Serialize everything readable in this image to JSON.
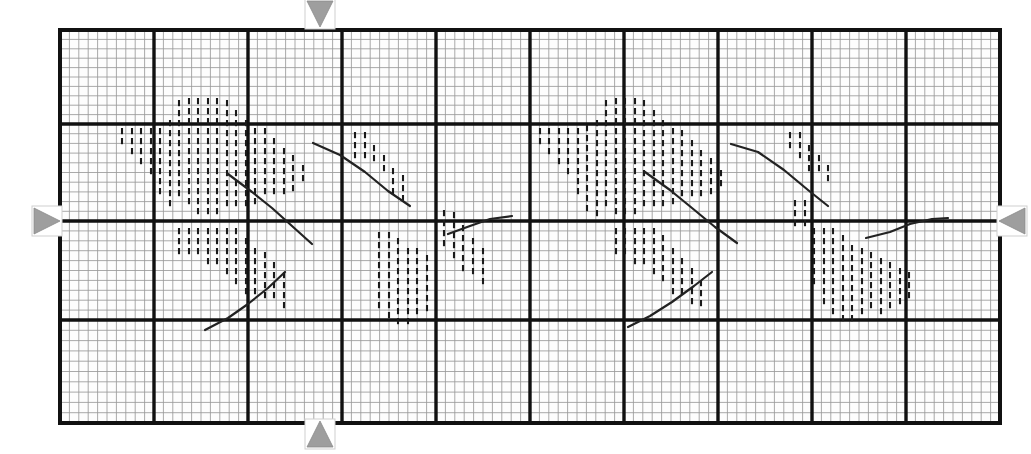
{
  "document": {
    "kind": "scanned-chart-recording",
    "title": "Strip Chart Recording Sheet",
    "background_color": "#ffffff",
    "paper_color": "#fdfdfd",
    "minor_grid_color": "#9a9a9a",
    "major_grid_color": "#111111",
    "tick_mark_color": "#1a1a1a",
    "curve_color": "#222222",
    "marker_color": "#9e9e9e",
    "marker_outline_color": "#cfcfcf"
  },
  "plot_frame": {
    "left": 60,
    "top": 30,
    "right": 1000,
    "bottom": 423,
    "major_border_width": 4
  },
  "markers": [
    {
      "name": "top-alignment-marker",
      "glyph": "triangle-down",
      "x": 320,
      "y": 14,
      "size": 13
    },
    {
      "name": "bottom-alignment-marker",
      "glyph": "triangle-up",
      "x": 320,
      "y": 434,
      "size": 13
    },
    {
      "name": "left-alignment-marker",
      "glyph": "triangle-right",
      "x": 47,
      "y": 221,
      "size": 13
    },
    {
      "name": "right-alignment-marker",
      "glyph": "triangle-left",
      "x": 1012,
      "y": 221,
      "size": 13
    }
  ],
  "chart_data": {
    "type": "scatter",
    "subtitle": "",
    "xlabel": "",
    "ylabel": "",
    "grid": true,
    "legend_position": "none",
    "axis_ranges": {
      "xlim": [
        0,
        10
      ],
      "ylim": [
        0,
        4
      ]
    },
    "grid_structure": {
      "major_columns": 10,
      "major_rows": 4,
      "minor_per_major_x": 10,
      "minor_per_major_y": 10,
      "major_x_positions": [
        60,
        154,
        248,
        342,
        436,
        530,
        624,
        718,
        812,
        906,
        1000
      ],
      "major_y_positions": [
        30,
        124,
        221,
        320,
        423
      ]
    },
    "series": [
      {
        "name": "tick-cluster-left-upper",
        "style": "vertical-dash-marks",
        "columns": [
          {
            "x": 122,
            "count": 2,
            "y_start": 128,
            "step": 10
          },
          {
            "x": 132,
            "count": 3,
            "y_start": 128,
            "step": 10
          },
          {
            "x": 141,
            "count": 4,
            "y_start": 128,
            "step": 10
          },
          {
            "x": 151,
            "count": 5,
            "y_start": 128,
            "step": 10
          },
          {
            "x": 160,
            "count": 7,
            "y_start": 128,
            "step": 10
          },
          {
            "x": 170,
            "count": 9,
            "y_start": 120,
            "step": 10
          },
          {
            "x": 179,
            "count": 10,
            "y_start": 100,
            "step": 10
          },
          {
            "x": 189,
            "count": 11,
            "y_start": 98,
            "step": 10
          },
          {
            "x": 198,
            "count": 12,
            "y_start": 98,
            "step": 10
          },
          {
            "x": 208,
            "count": 12,
            "y_start": 98,
            "step": 10
          },
          {
            "x": 217,
            "count": 12,
            "y_start": 98,
            "step": 10
          },
          {
            "x": 227,
            "count": 11,
            "y_start": 100,
            "step": 10
          },
          {
            "x": 236,
            "count": 10,
            "y_start": 110,
            "step": 10
          },
          {
            "x": 246,
            "count": 9,
            "y_start": 120,
            "step": 10
          },
          {
            "x": 255,
            "count": 8,
            "y_start": 128,
            "step": 10
          },
          {
            "x": 265,
            "count": 7,
            "y_start": 128,
            "step": 10
          },
          {
            "x": 274,
            "count": 6,
            "y_start": 138,
            "step": 10
          },
          {
            "x": 284,
            "count": 5,
            "y_start": 148,
            "step": 10
          },
          {
            "x": 293,
            "count": 4,
            "y_start": 155,
            "step": 10
          },
          {
            "x": 303,
            "count": 2,
            "y_start": 165,
            "step": 10
          }
        ]
      },
      {
        "name": "tick-cluster-left-lower",
        "style": "vertical-dash-marks",
        "columns": [
          {
            "x": 179,
            "count": 3,
            "y_start": 228,
            "step": 10
          },
          {
            "x": 189,
            "count": 3,
            "y_start": 228,
            "step": 10
          },
          {
            "x": 198,
            "count": 3,
            "y_start": 228,
            "step": 10
          },
          {
            "x": 208,
            "count": 4,
            "y_start": 228,
            "step": 10
          },
          {
            "x": 217,
            "count": 4,
            "y_start": 228,
            "step": 10
          },
          {
            "x": 227,
            "count": 5,
            "y_start": 228,
            "step": 10
          },
          {
            "x": 236,
            "count": 6,
            "y_start": 228,
            "step": 10
          },
          {
            "x": 246,
            "count": 6,
            "y_start": 238,
            "step": 10
          },
          {
            "x": 255,
            "count": 5,
            "y_start": 248,
            "step": 10
          },
          {
            "x": 265,
            "count": 5,
            "y_start": 252,
            "step": 10
          },
          {
            "x": 274,
            "count": 4,
            "y_start": 262,
            "step": 10
          },
          {
            "x": 284,
            "count": 4,
            "y_start": 272,
            "step": 10
          }
        ]
      },
      {
        "name": "tick-cluster-mid-left",
        "style": "vertical-dash-marks",
        "columns": [
          {
            "x": 355,
            "count": 3,
            "y_start": 132,
            "step": 10
          },
          {
            "x": 365,
            "count": 3,
            "y_start": 132,
            "step": 10
          },
          {
            "x": 374,
            "count": 2,
            "y_start": 145,
            "step": 10
          },
          {
            "x": 384,
            "count": 2,
            "y_start": 155,
            "step": 10
          },
          {
            "x": 393,
            "count": 3,
            "y_start": 168,
            "step": 10
          },
          {
            "x": 403,
            "count": 3,
            "y_start": 175,
            "step": 10
          },
          {
            "x": 379,
            "count": 8,
            "y_start": 232,
            "step": 10
          },
          {
            "x": 389,
            "count": 9,
            "y_start": 232,
            "step": 10
          },
          {
            "x": 398,
            "count": 9,
            "y_start": 238,
            "step": 10
          },
          {
            "x": 408,
            "count": 8,
            "y_start": 248,
            "step": 10
          },
          {
            "x": 417,
            "count": 7,
            "y_start": 248,
            "step": 10
          },
          {
            "x": 427,
            "count": 6,
            "y_start": 255,
            "step": 10
          },
          {
            "x": 444,
            "count": 4,
            "y_start": 210,
            "step": 10
          },
          {
            "x": 454,
            "count": 5,
            "y_start": 212,
            "step": 10
          },
          {
            "x": 463,
            "count": 5,
            "y_start": 225,
            "step": 10
          },
          {
            "x": 473,
            "count": 4,
            "y_start": 238,
            "step": 10
          },
          {
            "x": 483,
            "count": 4,
            "y_start": 248,
            "step": 10
          }
        ]
      },
      {
        "name": "tick-cluster-right-upper",
        "style": "vertical-dash-marks",
        "columns": [
          {
            "x": 540,
            "count": 2,
            "y_start": 128,
            "step": 10
          },
          {
            "x": 549,
            "count": 3,
            "y_start": 128,
            "step": 10
          },
          {
            "x": 559,
            "count": 4,
            "y_start": 128,
            "step": 10
          },
          {
            "x": 568,
            "count": 5,
            "y_start": 128,
            "step": 10
          },
          {
            "x": 578,
            "count": 7,
            "y_start": 128,
            "step": 10
          },
          {
            "x": 587,
            "count": 9,
            "y_start": 125,
            "step": 10
          },
          {
            "x": 597,
            "count": 10,
            "y_start": 120,
            "step": 10
          },
          {
            "x": 606,
            "count": 11,
            "y_start": 100,
            "step": 10
          },
          {
            "x": 616,
            "count": 12,
            "y_start": 98,
            "step": 10
          },
          {
            "x": 625,
            "count": 12,
            "y_start": 98,
            "step": 10
          },
          {
            "x": 635,
            "count": 12,
            "y_start": 98,
            "step": 10
          },
          {
            "x": 644,
            "count": 11,
            "y_start": 100,
            "step": 10
          },
          {
            "x": 654,
            "count": 10,
            "y_start": 110,
            "step": 10
          },
          {
            "x": 663,
            "count": 9,
            "y_start": 120,
            "step": 10
          },
          {
            "x": 673,
            "count": 8,
            "y_start": 128,
            "step": 10
          },
          {
            "x": 682,
            "count": 7,
            "y_start": 130,
            "step": 10
          },
          {
            "x": 692,
            "count": 6,
            "y_start": 140,
            "step": 10
          },
          {
            "x": 701,
            "count": 5,
            "y_start": 150,
            "step": 10
          },
          {
            "x": 711,
            "count": 4,
            "y_start": 158,
            "step": 10
          },
          {
            "x": 721,
            "count": 2,
            "y_start": 170,
            "step": 10
          }
        ]
      },
      {
        "name": "tick-cluster-right-lower",
        "style": "vertical-dash-marks",
        "columns": [
          {
            "x": 616,
            "count": 3,
            "y_start": 228,
            "step": 10
          },
          {
            "x": 625,
            "count": 3,
            "y_start": 228,
            "step": 10
          },
          {
            "x": 635,
            "count": 4,
            "y_start": 228,
            "step": 10
          },
          {
            "x": 644,
            "count": 4,
            "y_start": 228,
            "step": 10
          },
          {
            "x": 654,
            "count": 5,
            "y_start": 228,
            "step": 10
          },
          {
            "x": 663,
            "count": 5,
            "y_start": 235,
            "step": 10
          },
          {
            "x": 673,
            "count": 5,
            "y_start": 248,
            "step": 10
          },
          {
            "x": 682,
            "count": 4,
            "y_start": 258,
            "step": 10
          },
          {
            "x": 692,
            "count": 4,
            "y_start": 268,
            "step": 10
          },
          {
            "x": 701,
            "count": 3,
            "y_start": 280,
            "step": 10
          }
        ]
      },
      {
        "name": "tick-cluster-far-right",
        "style": "vertical-dash-marks",
        "columns": [
          {
            "x": 790,
            "count": 2,
            "y_start": 132,
            "step": 10
          },
          {
            "x": 800,
            "count": 3,
            "y_start": 132,
            "step": 10
          },
          {
            "x": 809,
            "count": 3,
            "y_start": 145,
            "step": 10
          },
          {
            "x": 819,
            "count": 2,
            "y_start": 155,
            "step": 10
          },
          {
            "x": 828,
            "count": 2,
            "y_start": 165,
            "step": 10
          },
          {
            "x": 795,
            "count": 3,
            "y_start": 200,
            "step": 10
          },
          {
            "x": 805,
            "count": 3,
            "y_start": 200,
            "step": 10
          },
          {
            "x": 814,
            "count": 6,
            "y_start": 228,
            "step": 10
          },
          {
            "x": 824,
            "count": 8,
            "y_start": 228,
            "step": 10
          },
          {
            "x": 833,
            "count": 9,
            "y_start": 228,
            "step": 10
          },
          {
            "x": 843,
            "count": 9,
            "y_start": 235,
            "step": 10
          },
          {
            "x": 852,
            "count": 8,
            "y_start": 245,
            "step": 10
          },
          {
            "x": 862,
            "count": 7,
            "y_start": 248,
            "step": 10
          },
          {
            "x": 871,
            "count": 6,
            "y_start": 252,
            "step": 10
          },
          {
            "x": 881,
            "count": 6,
            "y_start": 258,
            "step": 10
          },
          {
            "x": 890,
            "count": 5,
            "y_start": 262,
            "step": 10
          },
          {
            "x": 900,
            "count": 4,
            "y_start": 268,
            "step": 10
          },
          {
            "x": 909,
            "count": 3,
            "y_start": 272,
            "step": 10
          }
        ]
      }
    ],
    "curves": [
      {
        "name": "curve-left-a",
        "points": "228,174 252,192 272,208 292,226 312,244"
      },
      {
        "name": "curve-left-b",
        "points": "313,143 340,155 365,172 388,191 410,206"
      },
      {
        "name": "curve-left-c",
        "points": "205,330 228,318 248,304 268,288 285,272"
      },
      {
        "name": "curve-left-d",
        "points": "448,234 470,226 490,219 512,216"
      },
      {
        "name": "curve-mid",
        "points": "645,172 670,190 692,208 715,227 737,243"
      },
      {
        "name": "curve-right-a",
        "points": "731,144 758,152 784,170 808,190 828,206"
      },
      {
        "name": "curve-right-b",
        "points": "628,327 650,316 672,302 694,286 712,272"
      },
      {
        "name": "curve-right-c",
        "points": "866,238 890,232 910,224 932,219 948,218"
      }
    ]
  }
}
